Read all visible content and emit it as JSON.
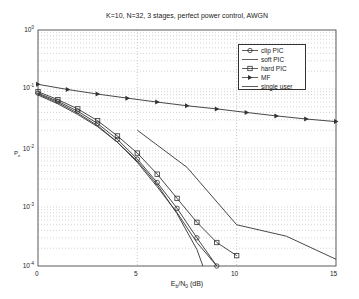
{
  "chart_data": {
    "type": "line",
    "title": "K=10, N=32, 3 stages, perfect power control, AWGN",
    "xlabel": "E_b/N_0 (dB)",
    "ylabel": "P_e",
    "xlim": [
      0,
      15
    ],
    "ylim": [
      0.0001,
      1
    ],
    "yscale": "log",
    "grid": true,
    "legend_position": "upper right",
    "x_ticks": [
      "0",
      "5",
      "10",
      "15"
    ],
    "y_ticks": [
      "10^0",
      "10^-1",
      "10^-2",
      "10^-3",
      "10^-4"
    ],
    "series": [
      {
        "name": "clip PIC",
        "marker": "circle",
        "x": [
          0,
          1,
          2,
          3,
          4,
          5,
          6,
          7,
          8,
          9
        ],
        "y": [
          0.085,
          0.062,
          0.042,
          0.026,
          0.014,
          0.0065,
          0.0026,
          0.00095,
          0.0003,
          8.5e-05
        ]
      },
      {
        "name": "soft PIC",
        "marker": "none",
        "x": [
          0,
          1,
          2,
          3,
          4,
          5,
          6,
          7,
          8,
          9
        ],
        "y": [
          0.082,
          0.059,
          0.039,
          0.024,
          0.0125,
          0.0057,
          0.0022,
          0.0008,
          0.00025,
          7e-05
        ]
      },
      {
        "name": "hard PIC",
        "marker": "square",
        "x": [
          0,
          1,
          2,
          3,
          4,
          5,
          6,
          7,
          8,
          9,
          10
        ],
        "y": [
          0.09,
          0.066,
          0.046,
          0.029,
          0.016,
          0.0082,
          0.0036,
          0.0014,
          0.00055,
          0.00025,
          0.00015
        ]
      },
      {
        "name": "MF",
        "marker": "triangle-right",
        "x": [
          0,
          1.5,
          3,
          4.5,
          6,
          7.5,
          9,
          10.5,
          12,
          13.5,
          15
        ],
        "y": [
          0.12,
          0.098,
          0.082,
          0.07,
          0.06,
          0.052,
          0.046,
          0.04,
          0.035,
          0.031,
          0.028
        ]
      },
      {
        "name": "single user",
        "marker": "none",
        "x": [
          0,
          1,
          2,
          3,
          4,
          5,
          6,
          7,
          8,
          8.3
        ],
        "y": [
          0.079,
          0.056,
          0.037,
          0.023,
          0.0125,
          0.006,
          0.0024,
          0.00077,
          0.00019,
          0.0001
        ]
      },
      {
        "name": "upper bound curve",
        "marker": "none",
        "x": [
          5,
          7.5,
          10,
          12.5,
          15
        ],
        "y": [
          0.02,
          0.0047,
          0.0005,
          0.00032,
          0.00013
        ]
      }
    ]
  },
  "legend": {
    "items": [
      {
        "label": "clip PIC",
        "marker": "circle"
      },
      {
        "label": "soft PIC",
        "marker": "none"
      },
      {
        "label": "hard PIC",
        "marker": "square"
      },
      {
        "label": "MF",
        "marker": "triangle"
      },
      {
        "label": "single user",
        "marker": "none"
      }
    ]
  },
  "axes": {
    "title": "K=10, N=32, 3 stages, perfect power control, AWGN",
    "xlabel": "E_b/N_0 (dB)",
    "ylabel": "P_e",
    "xticks": [
      "0",
      "5",
      "10",
      "15"
    ],
    "yticks": [
      "10",
      "10",
      "10",
      "10",
      "10"
    ],
    "yexp": [
      "0",
      "-1",
      "-2",
      "-3",
      "-4"
    ]
  },
  "colors": {
    "line": "#333333",
    "grid": "#bbbbbb",
    "axis": "#333333"
  }
}
